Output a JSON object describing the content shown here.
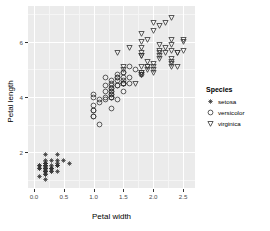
{
  "chart_data": {
    "type": "scatter",
    "title": "",
    "xlabel": "Petal width",
    "ylabel": "Petal length",
    "xlim": [
      -0.1,
      2.7
    ],
    "ylim": [
      0.7,
      7.3
    ],
    "x_ticks": [
      "0.0",
      "0.5",
      "1.0",
      "1.5",
      "2.0",
      "2.5"
    ],
    "x_tick_values": [
      0.0,
      0.5,
      1.0,
      1.5,
      2.0,
      2.5
    ],
    "y_ticks": [
      "2",
      "4",
      "6"
    ],
    "y_tick_values": [
      2,
      4,
      6
    ],
    "grid": true,
    "panel_background": "#ebebeb",
    "grid_color": "#ffffff",
    "point_color": "#333333",
    "legend": {
      "title": "Species",
      "position": "right",
      "entries": [
        {
          "label": "setosa",
          "marker": "asterisk-marker",
          "shape": 8
        },
        {
          "label": "versicolor",
          "marker": "circle-marker",
          "shape": 1
        },
        {
          "label": "virginica",
          "marker": "triangle-down-marker",
          "shape": 6
        }
      ]
    },
    "series": [
      {
        "name": "setosa",
        "marker": "asterisk-marker",
        "points": [
          [
            0.2,
            1.4
          ],
          [
            0.2,
            1.4
          ],
          [
            0.2,
            1.3
          ],
          [
            0.2,
            1.5
          ],
          [
            0.2,
            1.4
          ],
          [
            0.4,
            1.7
          ],
          [
            0.3,
            1.4
          ],
          [
            0.2,
            1.5
          ],
          [
            0.2,
            1.4
          ],
          [
            0.1,
            1.5
          ],
          [
            0.2,
            1.5
          ],
          [
            0.2,
            1.6
          ],
          [
            0.1,
            1.4
          ],
          [
            0.1,
            1.1
          ],
          [
            0.2,
            1.2
          ],
          [
            0.4,
            1.5
          ],
          [
            0.4,
            1.3
          ],
          [
            0.3,
            1.4
          ],
          [
            0.3,
            1.7
          ],
          [
            0.3,
            1.5
          ],
          [
            0.2,
            1.7
          ],
          [
            0.4,
            1.5
          ],
          [
            0.2,
            1.0
          ],
          [
            0.5,
            1.7
          ],
          [
            0.2,
            1.9
          ],
          [
            0.2,
            1.6
          ],
          [
            0.4,
            1.6
          ],
          [
            0.2,
            1.5
          ],
          [
            0.2,
            1.4
          ],
          [
            0.2,
            1.6
          ],
          [
            0.2,
            1.6
          ],
          [
            0.4,
            1.5
          ],
          [
            0.1,
            1.5
          ],
          [
            0.2,
            1.4
          ],
          [
            0.2,
            1.5
          ],
          [
            0.2,
            1.2
          ],
          [
            0.2,
            1.3
          ],
          [
            0.1,
            1.4
          ],
          [
            0.2,
            1.3
          ],
          [
            0.2,
            1.5
          ],
          [
            0.3,
            1.3
          ],
          [
            0.3,
            1.3
          ],
          [
            0.2,
            1.3
          ],
          [
            0.6,
            1.6
          ],
          [
            0.4,
            1.9
          ],
          [
            0.3,
            1.4
          ],
          [
            0.2,
            1.6
          ],
          [
            0.2,
            1.4
          ],
          [
            0.2,
            1.5
          ],
          [
            0.2,
            1.4
          ]
        ]
      },
      {
        "name": "versicolor",
        "marker": "circle-marker",
        "points": [
          [
            1.4,
            4.7
          ],
          [
            1.5,
            4.5
          ],
          [
            1.5,
            4.9
          ],
          [
            1.3,
            4.0
          ],
          [
            1.5,
            4.6
          ],
          [
            1.3,
            4.5
          ],
          [
            1.6,
            4.7
          ],
          [
            1.0,
            3.3
          ],
          [
            1.3,
            4.6
          ],
          [
            1.4,
            3.9
          ],
          [
            1.0,
            3.5
          ],
          [
            1.5,
            4.2
          ],
          [
            1.0,
            4.0
          ],
          [
            1.4,
            4.7
          ],
          [
            1.3,
            3.6
          ],
          [
            1.4,
            4.4
          ],
          [
            1.5,
            4.5
          ],
          [
            1.0,
            4.1
          ],
          [
            1.5,
            4.5
          ],
          [
            1.1,
            3.9
          ],
          [
            1.8,
            4.8
          ],
          [
            1.3,
            4.0
          ],
          [
            1.5,
            4.9
          ],
          [
            1.2,
            4.7
          ],
          [
            1.3,
            4.3
          ],
          [
            1.4,
            4.4
          ],
          [
            1.4,
            4.8
          ],
          [
            1.7,
            5.0
          ],
          [
            1.5,
            4.5
          ],
          [
            1.0,
            3.5
          ],
          [
            1.1,
            3.8
          ],
          [
            1.0,
            3.7
          ],
          [
            1.2,
            3.9
          ],
          [
            1.6,
            5.1
          ],
          [
            1.5,
            4.5
          ],
          [
            1.6,
            4.5
          ],
          [
            1.5,
            4.7
          ],
          [
            1.3,
            4.4
          ],
          [
            1.3,
            4.1
          ],
          [
            1.3,
            4.0
          ],
          [
            1.2,
            4.4
          ],
          [
            1.4,
            4.6
          ],
          [
            1.2,
            4.0
          ],
          [
            1.0,
            3.3
          ],
          [
            1.3,
            4.2
          ],
          [
            1.2,
            4.2
          ],
          [
            1.3,
            4.2
          ],
          [
            1.3,
            4.3
          ],
          [
            1.1,
            3.0
          ],
          [
            1.3,
            4.1
          ]
        ]
      },
      {
        "name": "virginica",
        "marker": "triangle-down-marker",
        "points": [
          [
            2.5,
            6.0
          ],
          [
            1.9,
            5.1
          ],
          [
            2.1,
            5.9
          ],
          [
            1.8,
            5.6
          ],
          [
            2.2,
            5.8
          ],
          [
            2.1,
            6.6
          ],
          [
            1.7,
            4.5
          ],
          [
            1.8,
            6.3
          ],
          [
            1.8,
            5.8
          ],
          [
            2.5,
            6.1
          ],
          [
            2.0,
            5.1
          ],
          [
            1.9,
            5.3
          ],
          [
            2.1,
            5.5
          ],
          [
            2.0,
            5.0
          ],
          [
            2.4,
            5.1
          ],
          [
            2.3,
            5.3
          ],
          [
            1.8,
            5.5
          ],
          [
            2.2,
            6.7
          ],
          [
            2.3,
            6.9
          ],
          [
            1.5,
            5.0
          ],
          [
            2.3,
            5.7
          ],
          [
            2.0,
            4.9
          ],
          [
            2.0,
            6.7
          ],
          [
            1.8,
            4.9
          ],
          [
            2.1,
            5.7
          ],
          [
            1.8,
            6.0
          ],
          [
            1.8,
            4.8
          ],
          [
            1.8,
            4.9
          ],
          [
            2.1,
            5.6
          ],
          [
            1.6,
            5.8
          ],
          [
            1.9,
            6.1
          ],
          [
            2.0,
            6.4
          ],
          [
            2.2,
            5.6
          ],
          [
            1.5,
            5.1
          ],
          [
            1.4,
            5.6
          ],
          [
            2.3,
            6.1
          ],
          [
            2.4,
            5.6
          ],
          [
            1.8,
            5.5
          ],
          [
            1.8,
            4.8
          ],
          [
            2.1,
            5.4
          ],
          [
            2.4,
            5.6
          ],
          [
            2.3,
            5.1
          ],
          [
            1.9,
            5.1
          ],
          [
            2.3,
            5.9
          ],
          [
            2.5,
            5.7
          ],
          [
            2.3,
            5.2
          ],
          [
            1.9,
            5.0
          ],
          [
            2.0,
            5.2
          ],
          [
            2.3,
            5.4
          ],
          [
            1.8,
            5.1
          ]
        ]
      }
    ]
  }
}
